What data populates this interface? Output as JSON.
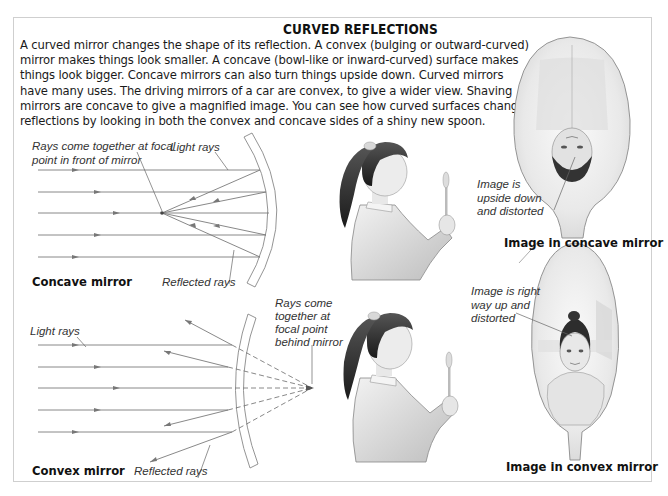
{
  "title": "CURVED REFLECTIONS",
  "intro_lines": [
    "A curved mirror changes the shape of its reflection. A convex (bulging or outward-curved)",
    "mirror makes things look smaller. A concave (bowl-like or inward-curved) surface makes",
    "things look bigger. Concave mirrors can also turn things upside down. Curved mirrors",
    "have many uses. The driving mirrors of a car are convex, to give a wider view. Shaving",
    "mirrors are concave to give a magnified image. You can see how curved surfaces change",
    "reflections by looking in both the convex and concave sides of a shiny new spoon."
  ],
  "concave_diagram": {
    "caption": "Concave mirror",
    "label_focal": [
      "Rays come together at focal",
      "point in front of mirror"
    ],
    "label_light_rays": "Light rays",
    "label_reflected_rays": "Reflected rays"
  },
  "convex_diagram": {
    "caption": "Convex mirror",
    "label_light_rays": "Light rays",
    "label_focal": [
      "Rays come",
      "together at",
      "focal point",
      "behind mirror"
    ],
    "label_reflected_rays": "Reflected rays"
  },
  "concave_spoon": {
    "caption": "Image in concave mirror",
    "annotation": [
      "Image is",
      "upside down",
      "and distorted"
    ]
  },
  "convex_spoon": {
    "caption": "Image in convex mirror",
    "annotation": [
      "Image is right",
      "way up and",
      "distorted"
    ]
  },
  "figures": {
    "girl_top": "girl-holding-spoon",
    "girl_bottom": "girl-holding-spoon"
  },
  "colors": {
    "ray": "#7a7a7a",
    "border": "#cfcfcf",
    "text": "#1a1a1a"
  }
}
